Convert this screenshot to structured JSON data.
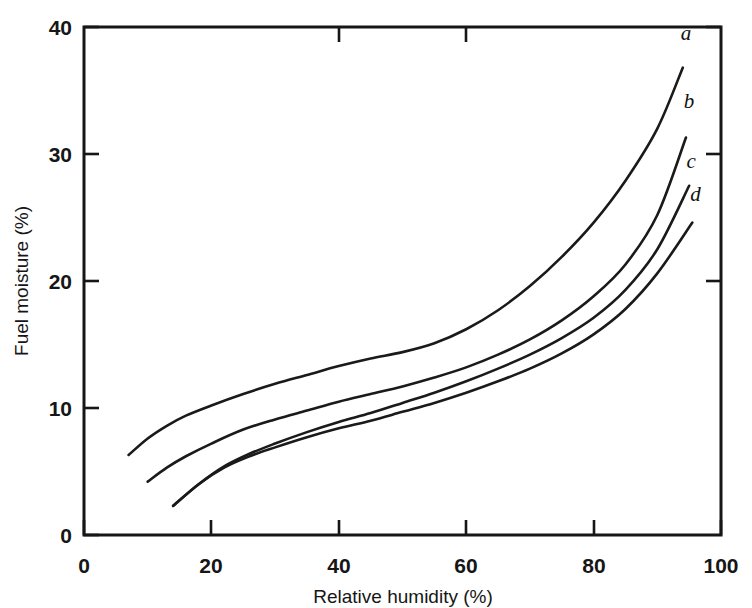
{
  "chart_data": {
    "type": "line",
    "title": "",
    "xlabel": "Relative humidity (%)",
    "ylabel": "Fuel moisture (%)",
    "xlim": [
      0,
      100
    ],
    "ylim": [
      0,
      40
    ],
    "xticks": [
      0,
      20,
      40,
      60,
      80,
      100
    ],
    "yticks": [
      0,
      10,
      20,
      30,
      40
    ],
    "xtick_labels": [
      "0",
      "20",
      "40",
      "60",
      "80",
      "100"
    ],
    "ytick_labels": [
      "0",
      "10",
      "20",
      "30",
      "40"
    ],
    "grid": false,
    "legend": "inline-end-labels",
    "frame": "box",
    "series": [
      {
        "name": "a",
        "label": "a",
        "label_x": 94.5,
        "label_y": 39.0,
        "x": [
          7,
          10,
          13,
          16,
          20,
          25,
          30,
          35,
          40,
          45,
          50,
          55,
          60,
          65,
          70,
          75,
          80,
          85,
          90,
          94
        ],
        "y": [
          6.3,
          7.6,
          8.6,
          9.4,
          10.2,
          11.1,
          11.9,
          12.6,
          13.3,
          13.9,
          14.4,
          15.1,
          16.2,
          17.7,
          19.6,
          21.9,
          24.6,
          27.9,
          32.0,
          36.8
        ]
      },
      {
        "name": "b",
        "label": "b",
        "label_x": 95.0,
        "label_y": 33.6,
        "x": [
          10,
          13,
          16,
          20,
          25,
          30,
          35,
          40,
          45,
          50,
          55,
          60,
          65,
          70,
          75,
          80,
          85,
          90,
          94.5
        ],
        "y": [
          4.2,
          5.3,
          6.2,
          7.2,
          8.3,
          9.1,
          9.8,
          10.5,
          11.1,
          11.7,
          12.4,
          13.2,
          14.2,
          15.4,
          16.9,
          18.8,
          21.3,
          25.2,
          31.3
        ]
      },
      {
        "name": "c",
        "label": "c",
        "label_x": 95.3,
        "label_y": 28.9,
        "x": [
          14,
          18,
          22,
          26,
          30,
          35,
          40,
          45,
          50,
          55,
          60,
          65,
          70,
          75,
          80,
          85,
          90,
          95
        ],
        "y": [
          2.3,
          4.0,
          5.4,
          6.4,
          7.2,
          8.1,
          8.9,
          9.6,
          10.4,
          11.2,
          12.1,
          13.1,
          14.2,
          15.5,
          17.1,
          19.3,
          22.5,
          27.5
        ]
      },
      {
        "name": "d",
        "label": "d",
        "label_x": 96.0,
        "label_y": 26.3,
        "x": [
          14,
          18,
          22,
          26,
          30,
          35,
          40,
          45,
          50,
          55,
          60,
          65,
          70,
          75,
          80,
          85,
          90,
          95.5
        ],
        "y": [
          2.3,
          4.0,
          5.3,
          6.2,
          6.9,
          7.7,
          8.4,
          9.0,
          9.7,
          10.4,
          11.2,
          12.1,
          13.1,
          14.3,
          15.8,
          17.8,
          20.6,
          24.6
        ]
      }
    ]
  },
  "colors": {
    "ink": "#161616",
    "background": "#ffffff",
    "curve": "#1a1a1a"
  }
}
